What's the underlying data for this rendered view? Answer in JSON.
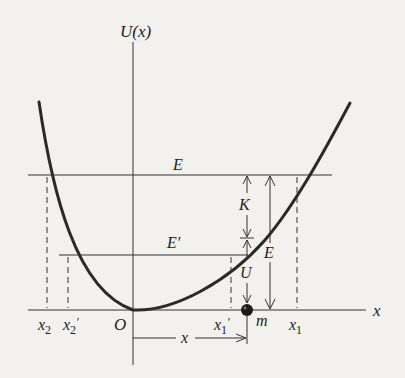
{
  "diagram": {
    "axes": {
      "y_label": "U(x)",
      "x_label": "x",
      "origin_label": "O"
    },
    "levels": {
      "E_label": "E",
      "E_prime_label": "E′"
    },
    "points": {
      "x2": "x",
      "x2_sub": "2",
      "x2p": "x",
      "x2p_sub": "2",
      "x2p_prime": "′",
      "x1p": "x",
      "x1p_sub": "1",
      "x1p_prime": "′",
      "x1": "x",
      "x1_sub": "1"
    },
    "quantities": {
      "K": "K",
      "U": "U",
      "E": "E",
      "m": "m",
      "x_dist": "x"
    },
    "colors": {
      "background": "#f2f1ee",
      "ink": "#2a2a2a"
    }
  }
}
